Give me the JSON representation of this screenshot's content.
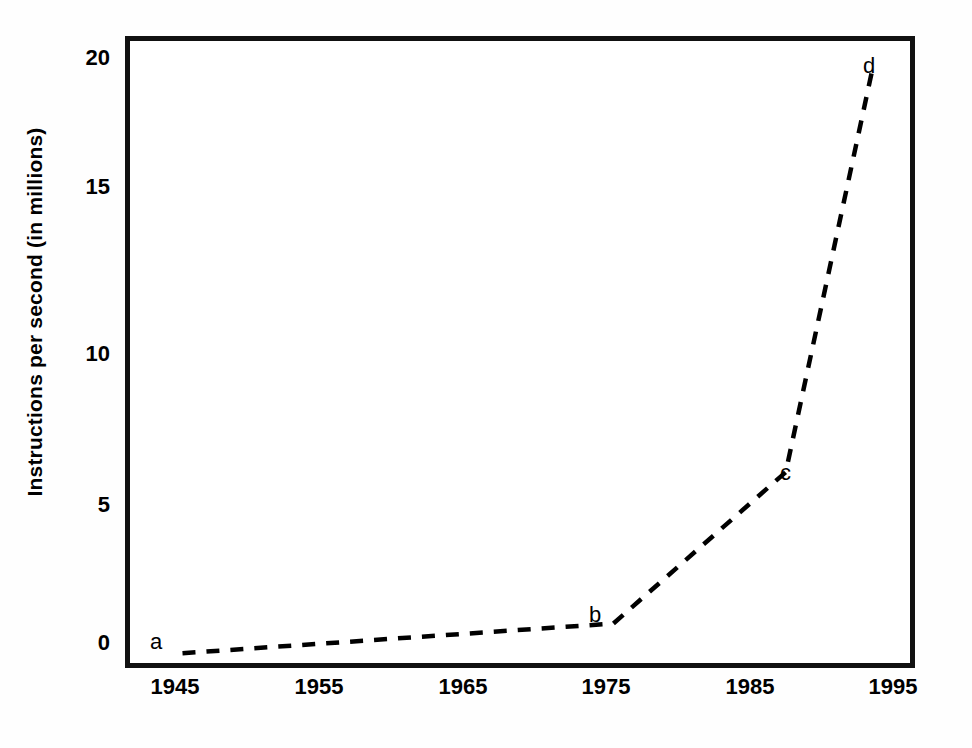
{
  "chart_data": {
    "type": "line",
    "title": "",
    "subtitle": "",
    "xlabel": "",
    "ylabel": "Instructions per second (in millions)",
    "xlim": [
      1941,
      1996
    ],
    "ylim": [
      -0.6,
      20.7
    ],
    "grid": false,
    "legend": "none",
    "line_style": "dashed",
    "line_color": "#000000",
    "x_tick_labels": [
      "1945",
      "1955",
      "1965",
      "1975",
      "1985",
      "1995"
    ],
    "x_tick_values": [
      1945,
      1955,
      1965,
      1975,
      1985,
      1995
    ],
    "y_tick_labels": [
      "0",
      "5",
      "10",
      "15",
      "20"
    ],
    "y_tick_values": [
      0,
      5,
      10,
      15,
      20
    ],
    "x": [
      1945,
      1975,
      1987,
      1993
    ],
    "values": [
      -0.1,
      0.9,
      6.0,
      19.5
    ],
    "point_labels": [
      "a",
      "b",
      "c",
      "d"
    ],
    "points": [
      {
        "label": "a",
        "x": 1945,
        "y": -0.1
      },
      {
        "label": "b",
        "x": 1975,
        "y": 0.9
      },
      {
        "label": "c",
        "x": 1987,
        "y": 6.0
      },
      {
        "label": "d",
        "x": 1993,
        "y": 19.5
      }
    ],
    "annotations": [
      {
        "text": "a",
        "x": 1945,
        "y": -0.1,
        "position": "left"
      },
      {
        "text": "b",
        "x": 1975,
        "y": 0.9,
        "position": "left"
      },
      {
        "text": "c",
        "x": 1987,
        "y": 6.0,
        "position": "right"
      },
      {
        "text": "d",
        "x": 1993,
        "y": 19.5,
        "position": "above"
      }
    ]
  },
  "figure": {
    "background_color": "#ffffff",
    "ink_color": "#000000",
    "frame_color": "#111111"
  }
}
